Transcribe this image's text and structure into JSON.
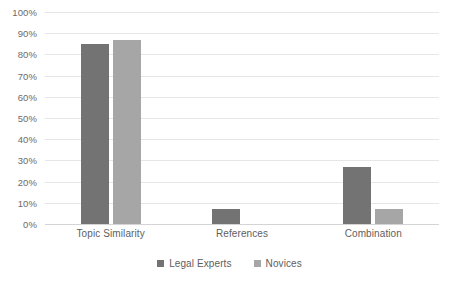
{
  "chart_data": {
    "type": "bar",
    "title": "",
    "subtitle": "",
    "xlabel": "",
    "ylabel": "",
    "categories": [
      "Topic Similarity",
      "References",
      "Combination"
    ],
    "series": [
      {
        "name": "Legal Experts",
        "color": "#737373",
        "values": [
          85,
          7,
          27
        ]
      },
      {
        "name": "Novices",
        "color": "#a6a6a6",
        "values": [
          87,
          0,
          7
        ]
      }
    ],
    "ylim": [
      0,
      100
    ],
    "ytick_step": 10,
    "ytick_labels": [
      "0%",
      "10%",
      "20%",
      "30%",
      "40%",
      "50%",
      "60%",
      "70%",
      "80%",
      "90%",
      "100%"
    ],
    "value_suffix": "%",
    "grid": {
      "horizontal": true,
      "vertical": false,
      "color": "#e6e6e6"
    },
    "legend": {
      "position": "bottom",
      "entries": [
        "Legal Experts",
        "Novices"
      ]
    },
    "annotations": []
  },
  "colors": {
    "background": "#ffffff",
    "gridline": "#e6e6e6",
    "baseline": "#d4d4d4",
    "axis_text": "#6b6b6b",
    "label_text": "#5e5e5e",
    "series_legal_experts": "#737373",
    "series_novices": "#a6a6a6"
  }
}
